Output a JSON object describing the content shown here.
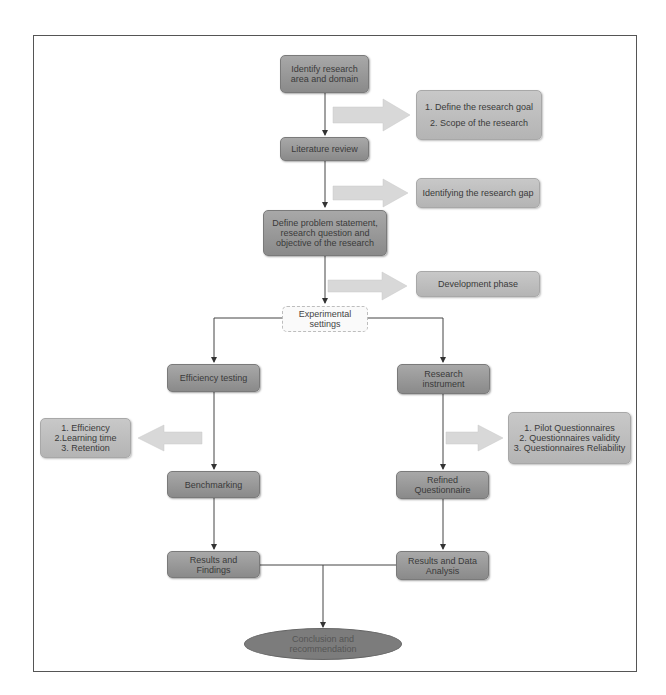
{
  "diagram": {
    "type": "flowchart",
    "nodes": {
      "identify": "Identify research area and domain",
      "literature": "Literature review",
      "define_problem": "Define problem statement, research question and objective of the research",
      "experimental": "Experimental settings",
      "efficiency_testing": "Efficiency testing",
      "research_instrument": "Research instrument",
      "benchmarking": "Benchmarking",
      "refined_questionnaire": "Refined Questionnaire",
      "results_findings": "Results and Findings",
      "results_analysis": "Results and Data Analysis",
      "conclusion": "Conclusion and recommendation"
    },
    "side_notes": {
      "goal_scope": {
        "line1": "1. Define the research goal",
        "line2": "2. Scope of the research"
      },
      "research_gap": "Identifying the research gap",
      "development": "Development phase",
      "efficiency_metrics": {
        "line1": "1. Efficiency",
        "line2": "2.Learning time",
        "line3": "3. Retention"
      },
      "questionnaire_steps": {
        "line1": "1. Pilot Questionnaires",
        "line2": "2. Questionnaires validity",
        "line3": "3. Questionnaires Reliability"
      }
    },
    "edges": [
      [
        "identify",
        "literature"
      ],
      [
        "literature",
        "define_problem"
      ],
      [
        "define_problem",
        "experimental"
      ],
      [
        "experimental",
        "efficiency_testing"
      ],
      [
        "experimental",
        "research_instrument"
      ],
      [
        "efficiency_testing",
        "benchmarking"
      ],
      [
        "research_instrument",
        "refined_questionnaire"
      ],
      [
        "benchmarking",
        "results_findings"
      ],
      [
        "refined_questionnaire",
        "results_analysis"
      ],
      [
        "results_findings",
        "conclusion"
      ],
      [
        "results_analysis",
        "conclusion"
      ]
    ],
    "colors": {
      "process_box": "#999999",
      "note_box": "#bebebe",
      "terminal": "#7c7c7c",
      "arrow_block": "#d6d6d6",
      "line": "#333333"
    }
  }
}
